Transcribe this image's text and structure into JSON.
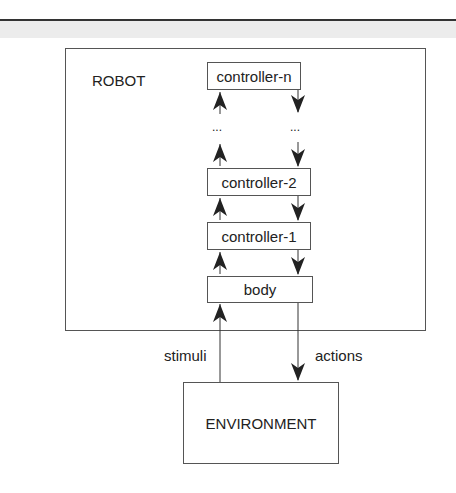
{
  "diagram": {
    "robot_label": "ROBOT",
    "layers": [
      {
        "label": "controller-n"
      },
      {
        "label": "..."
      },
      {
        "label": "controller-2"
      },
      {
        "label": "controller-1"
      },
      {
        "label": "body"
      }
    ],
    "ellipsis_left": "...",
    "ellipsis_right": "...",
    "environment_label": "ENVIRONMENT",
    "input_label": "stimuli",
    "output_label": "actions",
    "colors": {
      "line": "#333333",
      "band": "#ececec"
    }
  }
}
